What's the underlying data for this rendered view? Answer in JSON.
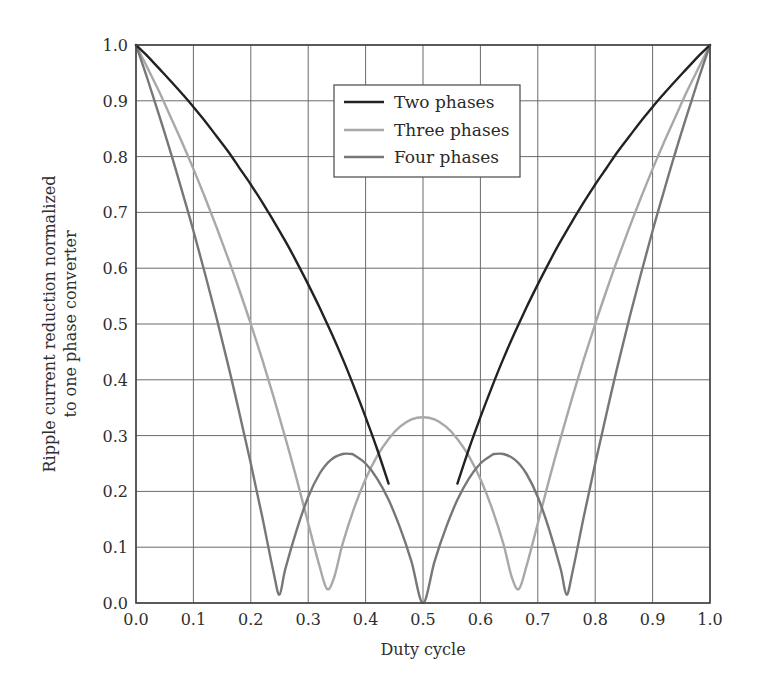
{
  "chart_data": {
    "type": "line",
    "title": "",
    "xlabel": "Duty cycle",
    "ylabel_lines": [
      "Ripple current reduction normalized",
      "to one phase converter"
    ],
    "ylabel": "Ripple current reduction normalized to one phase converter",
    "xlim": [
      0.0,
      1.0
    ],
    "ylim": [
      0.0,
      1.0
    ],
    "grid": true,
    "legend_position": "upper center",
    "x_ticks": [
      "0.0",
      "0.1",
      "0.2",
      "0.3",
      "0.4",
      "0.5",
      "0.6",
      "0.7",
      "0.8",
      "0.9",
      "1.0"
    ],
    "y_ticks": [
      "0.0",
      "0.1",
      "0.2",
      "0.3",
      "0.4",
      "0.5",
      "0.6",
      "0.7",
      "0.8",
      "0.9",
      "1.0"
    ],
    "series": [
      {
        "name": "Two phases",
        "color": "#222222",
        "segments": [
          {
            "x": [
              0.0,
              0.02,
              0.04,
              0.06,
              0.08,
              0.1,
              0.12,
              0.14,
              0.16,
              0.18,
              0.2,
              0.22,
              0.24,
              0.26,
              0.28,
              0.3,
              0.32,
              0.34,
              0.36,
              0.38,
              0.4,
              0.42,
              0.44
            ],
            "y": [
              1.0,
              0.98,
              0.958,
              0.936,
              0.913,
              0.889,
              0.864,
              0.837,
              0.81,
              0.78,
              0.75,
              0.718,
              0.684,
              0.649,
              0.611,
              0.571,
              0.529,
              0.485,
              0.438,
              0.387,
              0.333,
              0.276,
              0.214
            ]
          },
          {
            "x": [
              0.56,
              0.58,
              0.6,
              0.62,
              0.64,
              0.66,
              0.68,
              0.7,
              0.72,
              0.74,
              0.76,
              0.78,
              0.8,
              0.82,
              0.84,
              0.86,
              0.88,
              0.9,
              0.92,
              0.94,
              0.96,
              0.98,
              1.0
            ],
            "y": [
              0.214,
              0.276,
              0.333,
              0.387,
              0.438,
              0.485,
              0.529,
              0.571,
              0.611,
              0.649,
              0.684,
              0.718,
              0.75,
              0.78,
              0.81,
              0.837,
              0.864,
              0.889,
              0.913,
              0.936,
              0.958,
              0.98,
              1.0
            ]
          }
        ]
      },
      {
        "name": "Three phases",
        "color": "#a8a8a8",
        "segments": [
          {
            "x": [
              0.0,
              0.02,
              0.04,
              0.06,
              0.08,
              0.1,
              0.12,
              0.14,
              0.16,
              0.18,
              0.2,
              0.22,
              0.24,
              0.26,
              0.28,
              0.3,
              0.32,
              0.333,
              0.345,
              0.36,
              0.38,
              0.4,
              0.42,
              0.44,
              0.46,
              0.48,
              0.5,
              0.52,
              0.54,
              0.56,
              0.58,
              0.6,
              0.62,
              0.64,
              0.655,
              0.667,
              0.68,
              0.7,
              0.72,
              0.74,
              0.76,
              0.78,
              0.8,
              0.82,
              0.84,
              0.86,
              0.88,
              0.9,
              0.92,
              0.94,
              0.96,
              0.98,
              1.0
            ],
            "y": [
              1.0,
              0.959,
              0.917,
              0.872,
              0.826,
              0.778,
              0.727,
              0.674,
              0.619,
              0.561,
              0.5,
              0.436,
              0.368,
              0.297,
              0.222,
              0.143,
              0.065,
              0.025,
              0.045,
              0.106,
              0.17,
              0.222,
              0.263,
              0.294,
              0.316,
              0.329,
              0.333,
              0.329,
              0.316,
              0.294,
              0.263,
              0.222,
              0.17,
              0.106,
              0.045,
              0.025,
              0.065,
              0.143,
              0.222,
              0.297,
              0.368,
              0.436,
              0.5,
              0.561,
              0.619,
              0.674,
              0.727,
              0.778,
              0.826,
              0.872,
              0.917,
              0.959,
              1.0
            ]
          }
        ]
      },
      {
        "name": "Four phases",
        "color": "#777777",
        "segments": [
          {
            "x": [
              0.0,
              0.02,
              0.04,
              0.06,
              0.08,
              0.1,
              0.12,
              0.14,
              0.16,
              0.18,
              0.2,
              0.22,
              0.24,
              0.25,
              0.26,
              0.28,
              0.3,
              0.32,
              0.34,
              0.36,
              0.375,
              0.38,
              0.4,
              0.42,
              0.44,
              0.46,
              0.48,
              0.5,
              0.52,
              0.54,
              0.56,
              0.58,
              0.6,
              0.62,
              0.625,
              0.64,
              0.66,
              0.68,
              0.7,
              0.72,
              0.74,
              0.75,
              0.76,
              0.78,
              0.8,
              0.82,
              0.84,
              0.86,
              0.88,
              0.9,
              0.92,
              0.94,
              0.96,
              0.98,
              1.0
            ],
            "y": [
              1.0,
              0.939,
              0.875,
              0.809,
              0.739,
              0.667,
              0.591,
              0.512,
              0.429,
              0.341,
              0.25,
              0.154,
              0.053,
              0.015,
              0.06,
              0.131,
              0.19,
              0.232,
              0.257,
              0.267,
              0.267,
              0.265,
              0.25,
              0.223,
              0.185,
              0.135,
              0.074,
              0.0,
              0.074,
              0.135,
              0.185,
              0.223,
              0.25,
              0.265,
              0.267,
              0.267,
              0.257,
              0.232,
              0.19,
              0.131,
              0.06,
              0.015,
              0.053,
              0.154,
              0.25,
              0.341,
              0.429,
              0.512,
              0.591,
              0.667,
              0.739,
              0.809,
              0.875,
              0.939,
              1.0
            ]
          }
        ]
      }
    ]
  },
  "legend": {
    "items": [
      {
        "label": "Two phases",
        "color": "#222222"
      },
      {
        "label": "Three phases",
        "color": "#a8a8a8"
      },
      {
        "label": "Four phases",
        "color": "#777777"
      }
    ]
  },
  "layout": {
    "plot_left": 136,
    "plot_right": 710,
    "plot_top": 45,
    "plot_bottom": 603
  }
}
